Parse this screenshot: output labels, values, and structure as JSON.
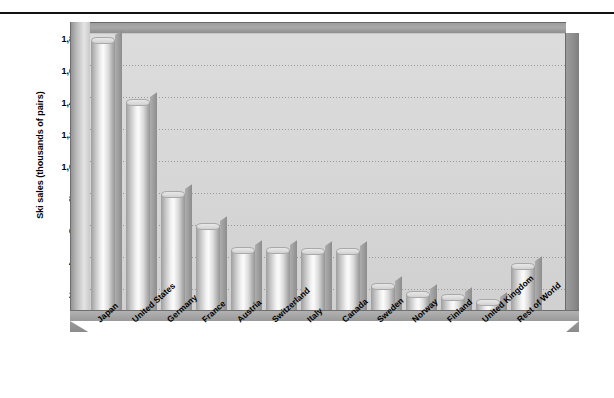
{
  "chart_data": {
    "type": "bar",
    "title": "",
    "xlabel": "",
    "ylabel": "Ski sales (thousands of pairs)",
    "ylim": [
      0,
      1800
    ],
    "ytick_labels": [
      "1,800",
      "1,600",
      "1,400",
      "1,200",
      "1,000",
      "800",
      "600",
      "400",
      "200",
      "0"
    ],
    "ytick_values": [
      1800,
      1600,
      1400,
      1200,
      1000,
      800,
      600,
      400,
      200,
      0
    ],
    "grid": true,
    "legend": "none",
    "style": "3d-cylinder",
    "categories": [
      "Japan",
      "United States",
      "Germany",
      "France",
      "Austria",
      "Switzerland",
      "Italy",
      "Canada",
      "Sweden",
      "Norway",
      "Finland",
      "United Kingdom",
      "Rest of World"
    ],
    "values": [
      1750,
      1360,
      790,
      590,
      440,
      440,
      430,
      430,
      215,
      165,
      145,
      110,
      340
    ]
  },
  "colors": {
    "plot_background": "#d6d6d6",
    "bar_light": "#fbfbfb",
    "bar_dark": "#979797",
    "frame": "#8d8d8d",
    "gridline": "#9a9a9a",
    "text": "#000000",
    "page_background": "#ffffff"
  }
}
